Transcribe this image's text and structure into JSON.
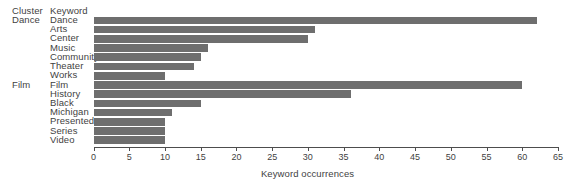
{
  "chart_data": {
    "type": "bar",
    "orientation": "horizontal",
    "title": "",
    "xlabel": "Keyword occurrences",
    "ylabel": "",
    "xlim": [
      0,
      65
    ],
    "xticks": [
      0,
      5,
      10,
      15,
      20,
      25,
      30,
      35,
      40,
      45,
      50,
      55,
      60,
      65
    ],
    "grid": false,
    "legend": false,
    "bar_color": "#6e6e6e",
    "group_header": "Cluster",
    "category_header": "Keyword",
    "categories": [
      "Dance",
      "Arts",
      "Center",
      "Music",
      "Community",
      "Theater",
      "Works",
      "Film",
      "History",
      "Black",
      "Michigan",
      "Presented",
      "Series",
      "Video"
    ],
    "values": [
      62,
      31,
      30,
      16,
      15,
      14,
      10,
      60,
      36,
      15,
      11,
      10,
      10,
      10
    ],
    "groups": [
      {
        "name": "Dance",
        "keywords": [
          "Dance",
          "Arts",
          "Center",
          "Music",
          "Community",
          "Theater",
          "Works"
        ],
        "values": [
          62,
          31,
          30,
          16,
          15,
          14,
          10
        ]
      },
      {
        "name": "Film",
        "keywords": [
          "Film",
          "History",
          "Black",
          "Michigan",
          "Presented",
          "Series",
          "Video"
        ],
        "values": [
          60,
          36,
          15,
          11,
          10,
          10,
          10
        ]
      }
    ],
    "rows": [
      {
        "cluster": "Dance",
        "keyword": "Dance",
        "value": 62
      },
      {
        "cluster": "",
        "keyword": "Arts",
        "value": 31
      },
      {
        "cluster": "",
        "keyword": "Center",
        "value": 30
      },
      {
        "cluster": "",
        "keyword": "Music",
        "value": 16
      },
      {
        "cluster": "",
        "keyword": "Community",
        "value": 15
      },
      {
        "cluster": "",
        "keyword": "Theater",
        "value": 14
      },
      {
        "cluster": "",
        "keyword": "Works",
        "value": 10
      },
      {
        "cluster": "Film",
        "keyword": "Film",
        "value": 60
      },
      {
        "cluster": "",
        "keyword": "History",
        "value": 36
      },
      {
        "cluster": "",
        "keyword": "Black",
        "value": 15
      },
      {
        "cluster": "",
        "keyword": "Michigan",
        "value": 11
      },
      {
        "cluster": "",
        "keyword": "Presented",
        "value": 10
      },
      {
        "cluster": "",
        "keyword": "Series",
        "value": 10
      },
      {
        "cluster": "",
        "keyword": "Video",
        "value": 10
      }
    ]
  }
}
